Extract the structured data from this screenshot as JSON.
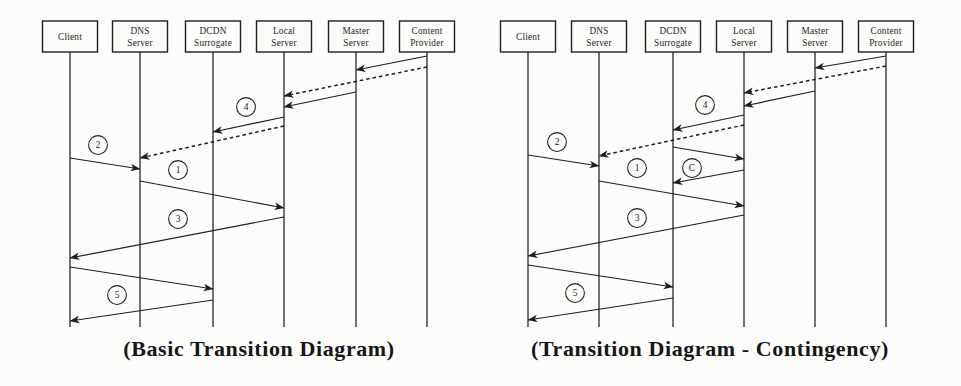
{
  "figure": {
    "width": 961,
    "height": 386,
    "background": "#fcfcfa",
    "ink": "#1f1f1f"
  },
  "diagrams": [
    {
      "id": "basic-transition-diagram",
      "caption": "(Basic Transition Diagram)",
      "caption_center_x": 259,
      "actors": [
        {
          "name": "Client",
          "lines": [
            "Client"
          ],
          "x": 70
        },
        {
          "name": "DNS Server",
          "lines": [
            "DNS",
            "Server"
          ],
          "x": 140
        },
        {
          "name": "DCDN Surrogate",
          "lines": [
            "DCDN",
            "Surrogate"
          ],
          "x": 213
        },
        {
          "name": "Local Server",
          "lines": [
            "Local",
            "Server"
          ],
          "x": 284
        },
        {
          "name": "Master Server",
          "lines": [
            "Master",
            "Server"
          ],
          "x": 356
        },
        {
          "name": "Content Provider",
          "lines": [
            "Content",
            "Provider"
          ],
          "x": 427
        }
      ],
      "messages": [
        {
          "from": "Content Provider",
          "to": "Master Server",
          "y1": 56,
          "y2": 70,
          "style": "solid"
        },
        {
          "from": "Content Provider",
          "to": "Local Server",
          "y1": 67,
          "y2": 96,
          "style": "dashed"
        },
        {
          "from": "Master Server",
          "to": "Local Server",
          "y1": 92,
          "y2": 107,
          "style": "solid"
        },
        {
          "from": "Local Server",
          "to": "DCDN Surrogate",
          "y1": 117,
          "y2": 132,
          "style": "solid"
        },
        {
          "from": "Local Server",
          "to": "DNS Server",
          "y1": 126,
          "y2": 158,
          "style": "dashed"
        },
        {
          "from": "Client",
          "to": "DNS Server",
          "y1": 158,
          "y2": 169,
          "style": "solid"
        },
        {
          "from": "DNS Server",
          "to": "Local Server",
          "y1": 181,
          "y2": 208,
          "style": "solid"
        },
        {
          "from": "Local Server",
          "to": "Client",
          "y1": 217,
          "y2": 258,
          "style": "solid"
        },
        {
          "from": "Client",
          "to": "DCDN Surrogate",
          "y1": 267,
          "y2": 289,
          "style": "solid"
        },
        {
          "from": "DCDN Surrogate",
          "to": "Client",
          "y1": 300,
          "y2": 321,
          "style": "solid"
        }
      ],
      "step_labels": [
        {
          "text": "4",
          "x": 246,
          "y": 107
        },
        {
          "text": "2",
          "x": 98,
          "y": 145
        },
        {
          "text": "1",
          "x": 178,
          "y": 170
        },
        {
          "text": "3",
          "x": 178,
          "y": 219
        },
        {
          "text": "5",
          "x": 117,
          "y": 295
        }
      ]
    },
    {
      "id": "transition-diagram-contingency",
      "caption": "(Transition Diagram - Contingency)",
      "caption_center_x": 710,
      "actors": [
        {
          "name": "Client",
          "lines": [
            "Client"
          ],
          "x": 528
        },
        {
          "name": "DNS Server",
          "lines": [
            "DNS",
            "Server"
          ],
          "x": 599
        },
        {
          "name": "DCDN Surrogate",
          "lines": [
            "DCDN",
            "Surrogate"
          ],
          "x": 673
        },
        {
          "name": "Local Server",
          "lines": [
            "Local",
            "Server"
          ],
          "x": 744
        },
        {
          "name": "Master Server",
          "lines": [
            "Master",
            "Server"
          ],
          "x": 815
        },
        {
          "name": "Content Provider",
          "lines": [
            "Content",
            "Provider"
          ],
          "x": 886
        }
      ],
      "messages": [
        {
          "from": "Content Provider",
          "to": "Master Server",
          "y1": 56,
          "y2": 68,
          "style": "solid"
        },
        {
          "from": "Content Provider",
          "to": "Local Server",
          "y1": 66,
          "y2": 93,
          "style": "dashed"
        },
        {
          "from": "Master Server",
          "to": "Local Server",
          "y1": 91,
          "y2": 106,
          "style": "solid"
        },
        {
          "from": "Local Server",
          "to": "DCDN Surrogate",
          "y1": 115,
          "y2": 130,
          "style": "solid"
        },
        {
          "from": "Local Server",
          "to": "DNS Server",
          "y1": 125,
          "y2": 156,
          "style": "dashed"
        },
        {
          "from": "Client",
          "to": "DNS Server",
          "y1": 155,
          "y2": 166,
          "style": "solid"
        },
        {
          "from": "DCDN Surrogate",
          "to": "Local Server",
          "y1": 147,
          "y2": 159,
          "style": "solid"
        },
        {
          "from": "Local Server",
          "to": "DCDN Surrogate",
          "y1": 170,
          "y2": 183,
          "style": "solid"
        },
        {
          "from": "DNS Server",
          "to": "Local Server",
          "y1": 181,
          "y2": 206,
          "style": "solid"
        },
        {
          "from": "Local Server",
          "to": "Client",
          "y1": 215,
          "y2": 256,
          "style": "solid"
        },
        {
          "from": "Client",
          "to": "DCDN Surrogate",
          "y1": 265,
          "y2": 287,
          "style": "solid"
        },
        {
          "from": "DCDN Surrogate",
          "to": "Client",
          "y1": 298,
          "y2": 320,
          "style": "solid"
        }
      ],
      "step_labels": [
        {
          "text": "4",
          "x": 705,
          "y": 105
        },
        {
          "text": "2",
          "x": 557,
          "y": 142
        },
        {
          "text": "1",
          "x": 637,
          "y": 168
        },
        {
          "text": "C",
          "x": 692,
          "y": 168
        },
        {
          "text": "3",
          "x": 637,
          "y": 218
        },
        {
          "text": "5",
          "x": 575,
          "y": 293
        }
      ]
    }
  ]
}
